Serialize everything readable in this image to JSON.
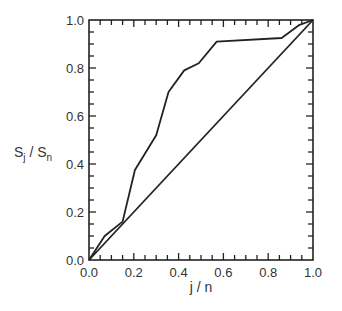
{
  "chart_data": {
    "type": "line",
    "title": "",
    "xlabel": "j / n",
    "ylabel": "S_j / S_n",
    "ylabel_parts": {
      "main1": "S",
      "sub1": "j",
      "sep": " / ",
      "main2": "S",
      "sub2": "n"
    },
    "xlim": [
      0.0,
      1.0
    ],
    "ylim": [
      0.0,
      1.0
    ],
    "grid": false,
    "legend": null,
    "x_ticks": [
      "0.0",
      "0.2",
      "0.4",
      "0.6",
      "0.8",
      "1.0"
    ],
    "y_ticks": [
      "0.0",
      "0.2",
      "0.4",
      "0.6",
      "0.8",
      "1.0"
    ],
    "minor_tick_step": 0.05,
    "series": [
      {
        "name": "cumulative curve",
        "x": [
          0.0,
          0.07,
          0.15,
          0.205,
          0.3,
          0.355,
          0.425,
          0.49,
          0.57,
          0.86,
          0.94,
          1.0
        ],
        "y": [
          0.0,
          0.1,
          0.16,
          0.375,
          0.52,
          0.7,
          0.79,
          0.82,
          0.91,
          0.925,
          0.98,
          1.0
        ]
      },
      {
        "name": "diagonal",
        "x": [
          0.0,
          1.0
        ],
        "y": [
          0.0,
          1.0
        ]
      }
    ],
    "colors": {
      "line": "#222222",
      "axis": "#222222",
      "background": "#ffffff"
    }
  }
}
